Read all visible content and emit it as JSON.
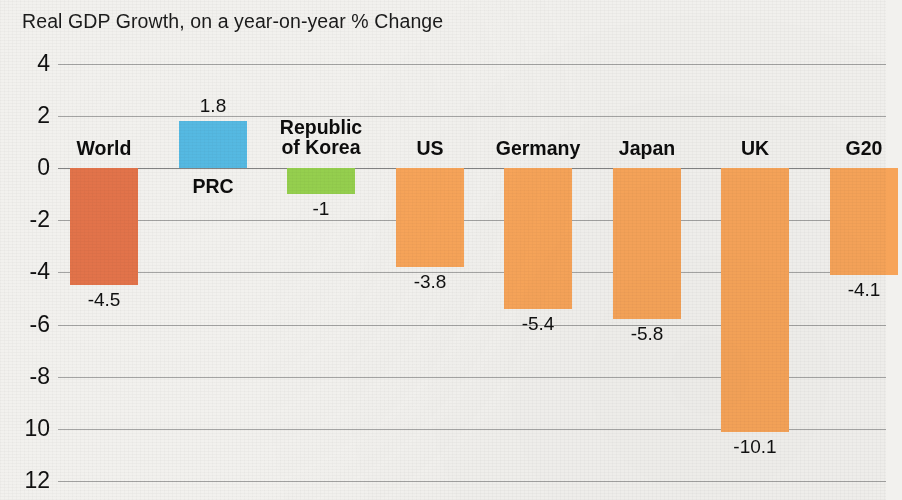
{
  "chart_data": {
    "type": "bar",
    "title": "Real GDP Growth, on a year-on-year % Change",
    "xlabel": "",
    "ylabel": "",
    "ylim": [
      -12,
      4
    ],
    "grid": true,
    "legend": "none",
    "ytick_labels": [
      "4",
      "2",
      "0",
      "-2",
      "-4",
      "-6",
      "-8",
      "10",
      "12"
    ],
    "ytick_values": [
      4,
      2,
      0,
      -2,
      -4,
      -6,
      -8,
      -10,
      -12
    ],
    "categories": [
      "World",
      "PRC",
      "Republic\nof Korea",
      "US",
      "Germany",
      "Japan",
      "UK",
      "G20"
    ],
    "values": [
      -4.5,
      1.8,
      -1,
      -3.8,
      -5.4,
      -5.8,
      -10.1,
      -4.1
    ],
    "value_labels": [
      "-4.5",
      "1.8",
      "-1",
      "-3.8",
      "-5.4",
      "-5.8",
      "-10.1",
      "-4.1"
    ],
    "bar_colors": [
      "#E2734A",
      "#55B9E2",
      "#95CF4E",
      "#F7A459",
      "#F7A459",
      "#F7A459",
      "#F7A459",
      "#F7A459"
    ]
  },
  "colors": {
    "background": "#f2f1ee",
    "gridline": "#8a8a8a",
    "text": "#1a1a1a",
    "orange": "#F7A459",
    "dark_orange": "#E2734A",
    "blue": "#55B9E2",
    "green": "#95CF4E"
  }
}
